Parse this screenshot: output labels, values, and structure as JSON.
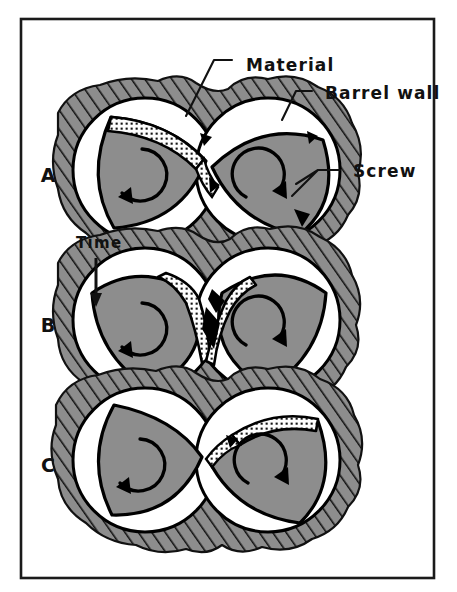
{
  "figure": {
    "frame": {
      "border_color": "#1a1a1a",
      "background": "#ffffff"
    }
  },
  "colors": {
    "screw_fill": "#8d8d8d",
    "barrel_fill": "#8d8d8d",
    "hatch_line": "#111111",
    "material_dots": "#141414",
    "material_bg": "#fdfdfd",
    "void_fill": "#ffffff",
    "outline": "#000000",
    "text": "#111111"
  },
  "annotations": [
    {
      "id": "material",
      "label": "Material",
      "x": 246,
      "y": 65,
      "leader_from": [
        232,
        60
      ],
      "leader_to": [
        186,
        116
      ]
    },
    {
      "id": "barrel_wall",
      "label": "Barrel wall",
      "x": 326,
      "y": 96,
      "leader_from": [
        312,
        91
      ],
      "leader_to": [
        285,
        118
      ]
    },
    {
      "id": "screw",
      "label": "Screw",
      "x": 352,
      "y": 174,
      "leader_from": [
        338,
        169
      ],
      "leader_to": [
        300,
        186
      ]
    }
  ],
  "time_axis": {
    "label": "Time",
    "x": 76,
    "y": 244,
    "arrow_from": [
      96,
      256
    ],
    "arrow_to": [
      96,
      303
    ]
  },
  "panels": [
    {
      "id": "A",
      "label": "A",
      "label_x": 48,
      "label_y": 182,
      "cy": 170,
      "description": "Material accumulates as a stippled crescent in the left screw channel near the intermesh",
      "material_state": "left-flank-crescent"
    },
    {
      "id": "B",
      "label": "B",
      "label_x": 48,
      "label_y": 332,
      "cy": 320,
      "description": "Material is drawn into a V-shaped wedge in the intermeshing region between the screws",
      "material_state": "intermesh-v-wedge"
    },
    {
      "id": "C",
      "label": "C",
      "label_x": 48,
      "label_y": 472,
      "cy": 460,
      "description": "Material has transferred onto the right screw flight as a stippled crescent",
      "material_state": "right-flank-crescent"
    }
  ],
  "screws": {
    "count_per_panel": 2,
    "left": {
      "rotation": "co-rotating",
      "arrow": "circular-arrow-left"
    },
    "right": {
      "rotation": "co-rotating",
      "arrow": "circular-arrow-right"
    }
  }
}
